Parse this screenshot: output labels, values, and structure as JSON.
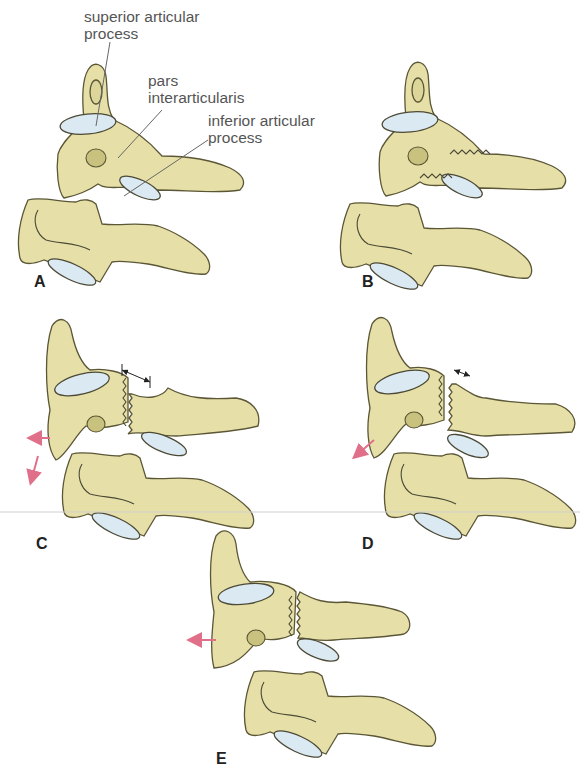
{
  "figure": {
    "labels": {
      "superior_articular_process": [
        "superior articular",
        "process"
      ],
      "pars_interarticularis": [
        "pars",
        "interarticularis"
      ],
      "inferior_articular_process": [
        "inferior articular",
        "process"
      ]
    },
    "panels": [
      {
        "letter": "A",
        "description": "Intact cervical vertebrae showing superior articular process, pars interarticularis and inferior articular process"
      },
      {
        "letter": "B",
        "description": "Fracture line through pars interarticularis"
      },
      {
        "letter": "C",
        "description": "Fracture with wide separation; posterior and inferior displacement arrows"
      },
      {
        "letter": "D",
        "description": "Fracture with moderate separation; posteroinferior displacement arrow"
      },
      {
        "letter": "E",
        "description": "Fracture with minimal separation; posterior displacement arrow"
      }
    ],
    "colors": {
      "bone": "#e6e0a8",
      "facet": "#dbe9f2",
      "outline": "#5b5636",
      "arrow": "#e0708a"
    }
  }
}
